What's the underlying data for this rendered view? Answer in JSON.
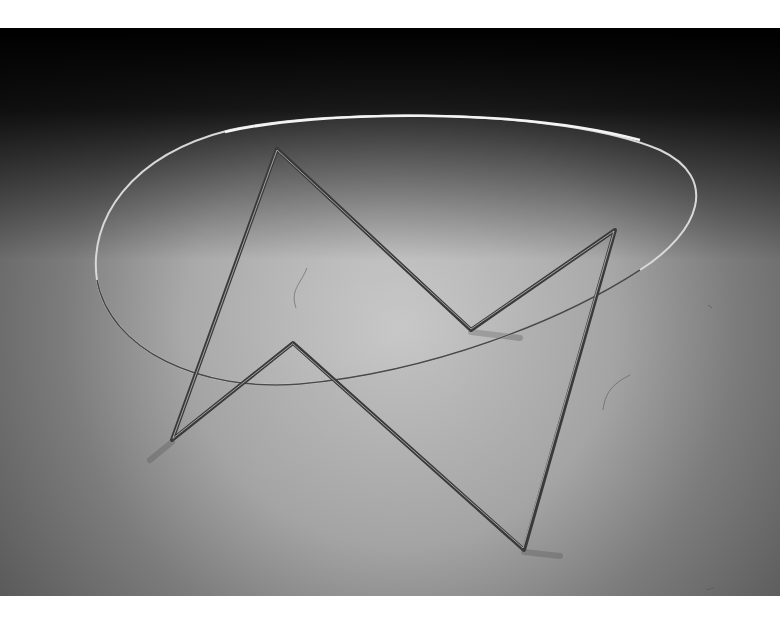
{
  "image": {
    "subject": "Glass-topped table on zig-zag wire frame",
    "style": "black-and-white photograph",
    "colors": {
      "border": "#ffffff",
      "background_dark": "#050505",
      "background_light": "#b9b9b9",
      "frame": "#3a3a3a",
      "glass_edge": "#e8e8e8"
    }
  }
}
